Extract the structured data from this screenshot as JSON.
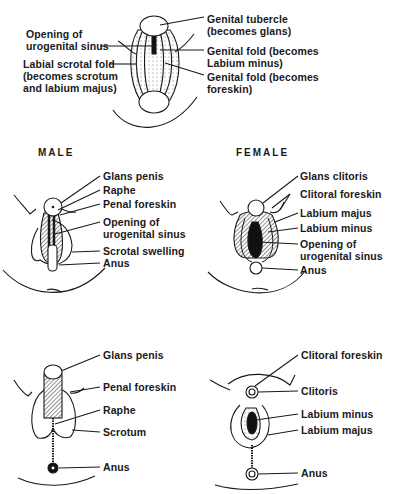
{
  "figure": {
    "top": {
      "left_labels": [
        {
          "id": "opening-urogenital-sinus",
          "text": "Opening of\nurogenital sinus"
        },
        {
          "id": "labial-scrotal-fold",
          "text": "Labial scrotal fold\n(becomes scrotum\nand labium majus)"
        }
      ],
      "right_labels": [
        {
          "id": "genital-tubercle",
          "text": "Genital tubercle\n(becomes glans)"
        },
        {
          "id": "genital-fold-labium",
          "text": "Genital fold (becomes\nLabium minus)"
        },
        {
          "id": "genital-fold-foreskin",
          "text": "Genital fold (becomes\nforeskin)"
        }
      ]
    },
    "middle": {
      "male": {
        "heading": "MALE",
        "labels": [
          "Glans penis",
          "Raphe",
          "Penal foreskin",
          "Opening of\nurogenital sinus",
          "Scrotal swelling",
          "Anus"
        ]
      },
      "female": {
        "heading": "FEMALE",
        "labels": [
          "Glans clitoris",
          "Clitoral foreskin",
          "Labium majus",
          "Labium minus",
          "Opening of\nurogenital sinus",
          "Anus"
        ]
      }
    },
    "bottom": {
      "male": {
        "labels": [
          "Glans penis",
          "Penal foreskin",
          "Raphe",
          "Scrotum",
          "Anus"
        ]
      },
      "female": {
        "labels": [
          "Clitoral foreskin",
          "Clitoris",
          "Labium minus",
          "Labium majus",
          "Anus"
        ]
      }
    }
  }
}
